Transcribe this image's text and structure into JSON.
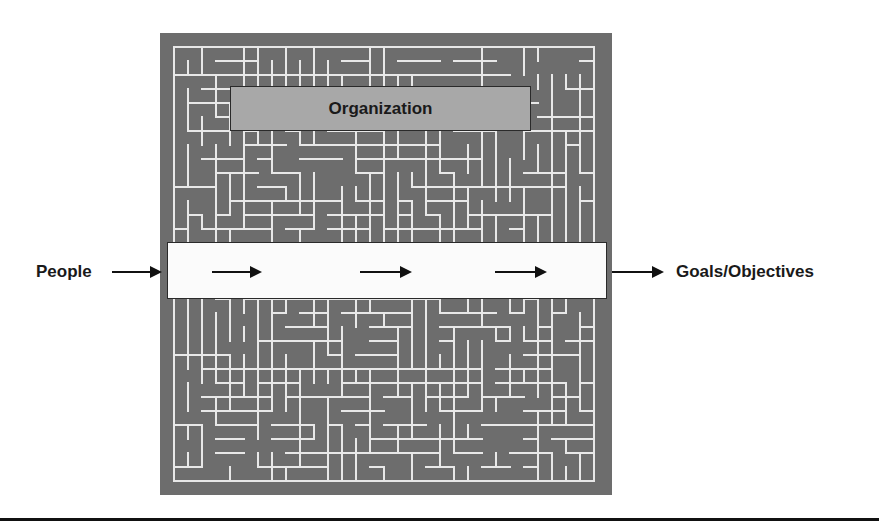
{
  "diagram": {
    "type": "maze-metaphor",
    "organization_label": "Organization",
    "input_label": "People",
    "output_label": "Goals/Objectives",
    "flow_arrows_in_band": 3,
    "colors": {
      "maze_background": "#6d6d6d",
      "maze_lines": "#e8e8e8",
      "organization_box": "#a8a8a8",
      "band": "#fbfbfb",
      "text": "#1a1a1a",
      "arrow": "#111111"
    }
  }
}
